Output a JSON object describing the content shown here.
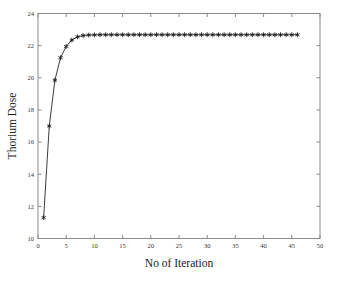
{
  "chart_data": {
    "type": "line",
    "title": "",
    "xlabel": "No of Iteration",
    "ylabel": "Thorium Dose",
    "xlim": [
      0,
      50
    ],
    "ylim": [
      10,
      24
    ],
    "xticks": [
      0,
      5,
      10,
      15,
      20,
      25,
      30,
      35,
      40,
      45,
      50
    ],
    "yticks": [
      10,
      12,
      14,
      16,
      18,
      20,
      22,
      24
    ],
    "xticklabels": [
      "0",
      "5",
      "10",
      "15",
      "20",
      "25",
      "30",
      "35",
      "40",
      "45",
      "50"
    ],
    "yticklabels": [
      "10",
      "12",
      "14",
      "16",
      "18",
      "20",
      "22",
      "24"
    ],
    "grid": false,
    "legend": null,
    "marker": "asterisk",
    "line_color": "#262626",
    "marker_color": "#161616",
    "series": [
      {
        "name": "Thorium Dose",
        "x": [
          1,
          2,
          3,
          4,
          5,
          6,
          7,
          8,
          9,
          10,
          11,
          12,
          13,
          14,
          15,
          16,
          17,
          18,
          19,
          20,
          21,
          22,
          23,
          24,
          25,
          26,
          27,
          28,
          29,
          30,
          31,
          32,
          33,
          34,
          35,
          36,
          37,
          38,
          39,
          40,
          41,
          42,
          43,
          44,
          45,
          46
        ],
        "y": [
          11.3,
          17.0,
          19.85,
          21.25,
          21.95,
          22.35,
          22.55,
          22.63,
          22.66,
          22.67,
          22.68,
          22.68,
          22.68,
          22.68,
          22.68,
          22.68,
          22.68,
          22.68,
          22.68,
          22.68,
          22.68,
          22.68,
          22.68,
          22.68,
          22.68,
          22.68,
          22.68,
          22.68,
          22.68,
          22.68,
          22.68,
          22.68,
          22.68,
          22.68,
          22.68,
          22.68,
          22.68,
          22.68,
          22.68,
          22.68,
          22.68,
          22.68,
          22.68,
          22.68,
          22.68,
          22.68
        ]
      }
    ]
  }
}
